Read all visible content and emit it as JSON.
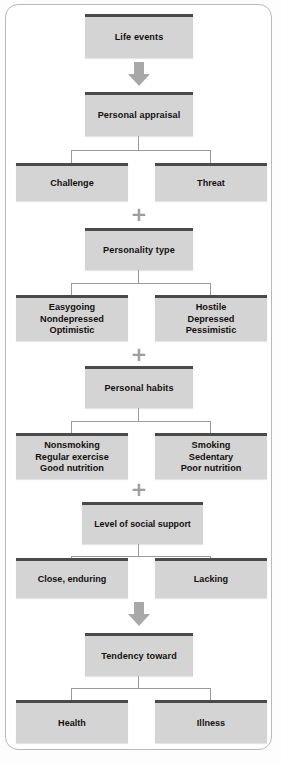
{
  "diagram": {
    "colors": {
      "box_fill": "#d4d4d4",
      "box_cap": "#4a4a4a",
      "connector": "#9a9a9a",
      "arrow": "#a8a8a8",
      "frame": "#b9b9b9",
      "text": "#14100e"
    },
    "nodes": {
      "life_events": "Life events",
      "personal_appraisal": "Personal appraisal",
      "challenge": "Challenge",
      "threat": "Threat",
      "personality_type": "Personality type",
      "easygoing": "Easygoing\nNondepressed\nOptimistic",
      "hostile": "Hostile\nDepressed\nPessimistic",
      "personal_habits": "Personal habits",
      "nonsmoking": "Nonsmoking\nRegular exercise\nGood nutrition",
      "smoking": "Smoking\nSedentary\nPoor nutrition",
      "social_support": "Level of social support",
      "close_enduring": "Close, enduring",
      "lacking": "Lacking",
      "tendency_toward": "Tendency toward",
      "health": "Health",
      "illness": "Illness"
    },
    "connectors": {
      "plus_symbol": "+",
      "arrow_1": "down-arrow-icon",
      "arrow_2": "down-arrow-icon"
    }
  }
}
